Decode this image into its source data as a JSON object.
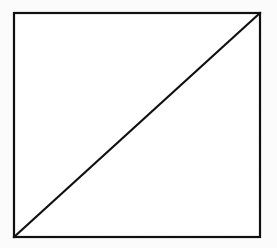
{
  "figure": {
    "canvas": {
      "width": 277,
      "height": 248,
      "background_color": "#fbfbfb"
    },
    "style": {
      "stroke_color": "#101010",
      "stroke_width": 2.2,
      "fill_color": "#ffffff"
    },
    "shapes": [
      {
        "name": "square-outline",
        "type": "rectangle",
        "x": 14,
        "y": 13,
        "width": 246,
        "height": 224,
        "stroke_color": "#101010",
        "stroke_width": 2.2,
        "fill_color": "#ffffff"
      },
      {
        "name": "diagonal-line",
        "type": "line",
        "x1": 14,
        "y1": 237,
        "x2": 260,
        "y2": 13,
        "stroke_color": "#101010",
        "stroke_width": 2.2
      }
    ],
    "vertices": [
      {
        "name": "top-left",
        "x": 14,
        "y": 13
      },
      {
        "name": "top-right",
        "x": 260,
        "y": 13
      },
      {
        "name": "bottom-right",
        "x": 260,
        "y": 237
      },
      {
        "name": "bottom-left",
        "x": 14,
        "y": 237
      }
    ],
    "regions": [
      {
        "name": "upper-left-triangle",
        "points": "14,13 260,13 14,237"
      },
      {
        "name": "lower-right-triangle",
        "points": "260,13 260,237 14,237"
      }
    ],
    "labels": []
  }
}
